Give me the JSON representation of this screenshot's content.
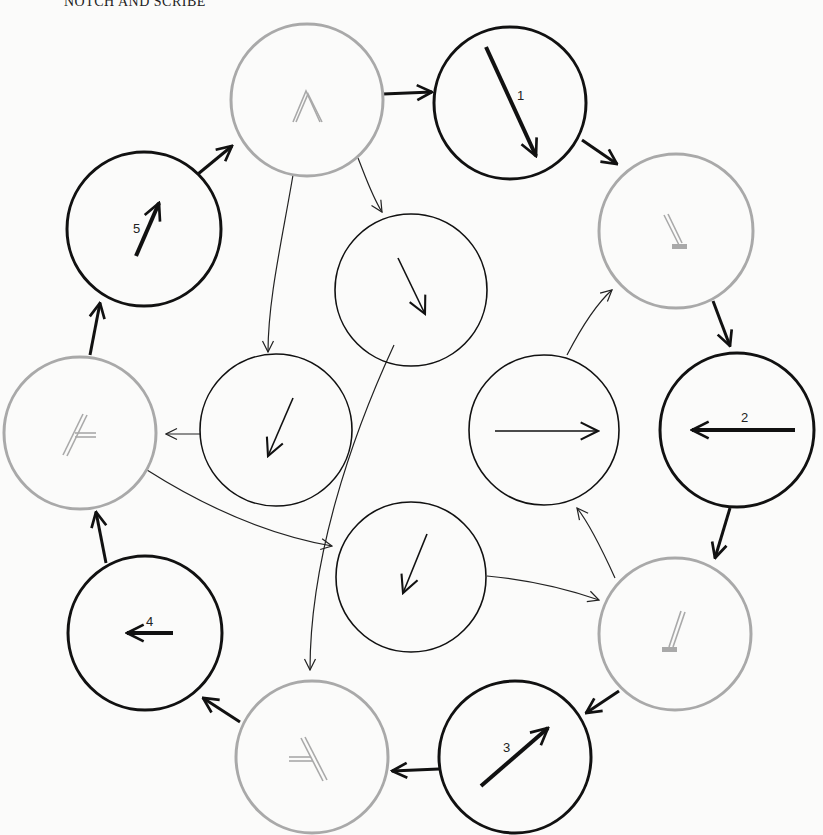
{
  "caption": "NOTCH AND SCRIBE",
  "colors": {
    "gray_node": "#a9a9a9",
    "black": "#111111",
    "background": "#fbfbfa"
  },
  "nodes": [
    {
      "id": "top-gray",
      "type": "gray",
      "cx": 307,
      "cy": 100,
      "r": 76,
      "glyph": "caret-up"
    },
    {
      "id": "n1",
      "type": "bold",
      "cx": 510,
      "cy": 103,
      "r": 76,
      "label": "1",
      "vector": "down-right"
    },
    {
      "id": "gray-right-top",
      "type": "gray",
      "cx": 676,
      "cy": 231,
      "r": 77,
      "glyph": "stem-foot"
    },
    {
      "id": "n2",
      "type": "bold",
      "cx": 737,
      "cy": 430,
      "r": 77,
      "label": "2",
      "vector": "left"
    },
    {
      "id": "gray-right-bottom",
      "type": "gray",
      "cx": 675,
      "cy": 634,
      "r": 76,
      "glyph": "stem-foot-tilted"
    },
    {
      "id": "n3",
      "type": "bold",
      "cx": 515,
      "cy": 757,
      "r": 76,
      "label": "3",
      "vector": "up-right"
    },
    {
      "id": "gray-bottom",
      "type": "gray",
      "cx": 312,
      "cy": 757,
      "r": 76,
      "glyph": "branch"
    },
    {
      "id": "n4",
      "type": "bold",
      "cx": 145,
      "cy": 633,
      "r": 77,
      "label": "4",
      "vector": "left"
    },
    {
      "id": "gray-left",
      "type": "gray",
      "cx": 80,
      "cy": 433,
      "r": 76,
      "glyph": "branch-left"
    },
    {
      "id": "n5",
      "type": "bold",
      "cx": 144,
      "cy": 229,
      "r": 77,
      "label": "5",
      "vector": "up-right"
    },
    {
      "id": "inner-top",
      "type": "thin",
      "cx": 411,
      "cy": 290,
      "r": 76,
      "vector": "down-right"
    },
    {
      "id": "inner-left",
      "type": "thin",
      "cx": 276,
      "cy": 430,
      "r": 76,
      "vector": "down-left"
    },
    {
      "id": "inner-right",
      "type": "thin",
      "cx": 544,
      "cy": 430,
      "r": 75,
      "vector": "right"
    },
    {
      "id": "inner-bottom",
      "type": "thin",
      "cx": 411,
      "cy": 577,
      "r": 75,
      "vector": "down-left"
    }
  ],
  "labels": {
    "n1": "1",
    "n2": "2",
    "n3": "3",
    "n4": "4",
    "n5": "5"
  }
}
